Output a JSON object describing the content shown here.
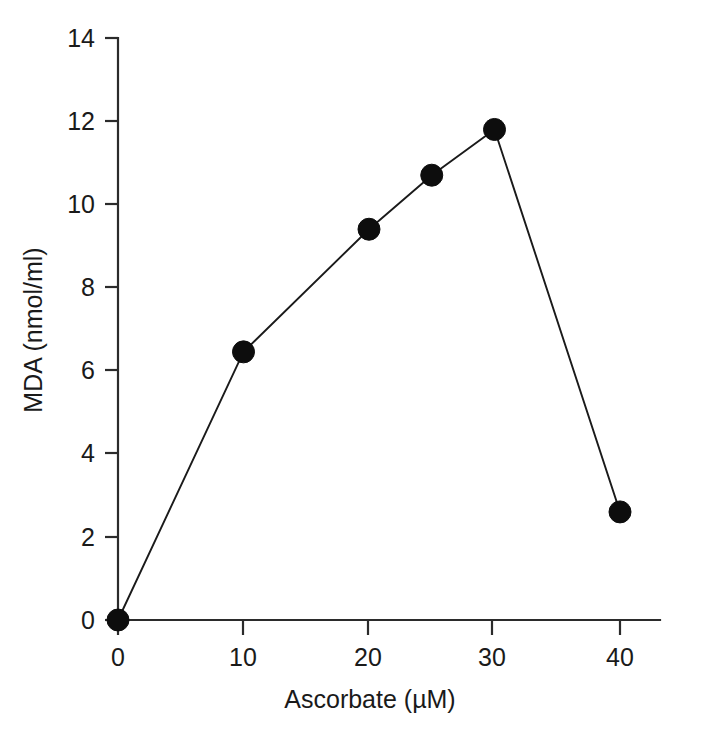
{
  "chart_data": {
    "type": "line",
    "title": "",
    "subtitle": "",
    "xlabel": "Ascorbate (µM)",
    "ylabel": "MDA (nmol/ml)",
    "x": [
      0,
      10,
      20,
      25,
      30,
      40
    ],
    "values": [
      0.0,
      6.45,
      9.4,
      10.7,
      11.8,
      2.6
    ],
    "series": [
      {
        "name": "MDA",
        "x": [
          0,
          10,
          20,
          25,
          30,
          40
        ],
        "values": [
          0.0,
          6.45,
          9.4,
          10.7,
          11.8,
          2.6
        ],
        "marker": "filled-circle",
        "marker_color": "#0d0d0d",
        "line_color": "#1a1a1a"
      }
    ],
    "xlim": [
      0,
      46
    ],
    "ylim": [
      0,
      14
    ],
    "xticks": [
      0,
      10,
      20,
      30,
      40
    ],
    "xtick_labels": [
      "0",
      "10",
      "20",
      "30",
      "40"
    ],
    "yticks": [
      0,
      2,
      4,
      6,
      8,
      10,
      12,
      14
    ],
    "ytick_labels": [
      "0",
      "2",
      "4",
      "6",
      "8",
      "10",
      "12",
      "14"
    ],
    "grid": false,
    "legend": null,
    "legend_position": "none",
    "annotations": []
  },
  "axes": {
    "x_title": "Ascorbate (µM)",
    "y_title": "MDA (nmol/ml)",
    "x_tick_labels": [
      "0",
      "10",
      "20",
      "30",
      "40"
    ],
    "y_tick_labels": [
      "0",
      "2",
      "4",
      "6",
      "8",
      "10",
      "12",
      "14"
    ]
  },
  "colors": {
    "background": "#ffffff",
    "axis": "#2b2b2b",
    "line": "#1a1a1a",
    "marker": "#0d0d0d",
    "text": "#1a1a1a"
  }
}
